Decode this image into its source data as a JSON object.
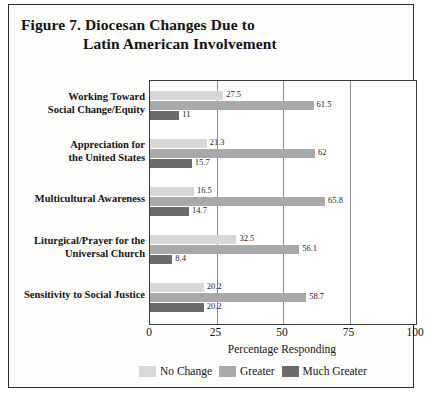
{
  "figure": {
    "title_line_1": "Figure 7.  Diocesan Changes Due to",
    "title_line_2": "Latin American Involvement"
  },
  "chart_data": {
    "type": "bar",
    "orientation": "horizontal",
    "title": "Figure 7.  Diocesan Changes Due to Latin American Involvement",
    "xlabel": "Percentage Responding",
    "ylabel": "",
    "xlim": [
      0,
      100
    ],
    "xticks": [
      0,
      25,
      50,
      75,
      100
    ],
    "grid": true,
    "legend_position": "bottom",
    "categories": [
      "Working Toward Social Change/Equity",
      "Appreciation for the United States",
      "Multicultural Awareness",
      "Liturgical/Prayer for the Universal Church",
      "Sensitivity to Social Justice"
    ],
    "series": [
      {
        "name": "No Change",
        "color": "#d7d7d7",
        "values": [
          27.5,
          21.3,
          16.5,
          32.5,
          20.2
        ]
      },
      {
        "name": "Greater",
        "color": "#a9a9a9",
        "values": [
          61.5,
          62.0,
          65.8,
          56.1,
          58.7
        ]
      },
      {
        "name": "Much Greater",
        "color": "#6b6b6b",
        "values": [
          11.0,
          15.7,
          14.7,
          8.4,
          20.2
        ]
      }
    ],
    "value_labels": [
      [
        "27.5",
        "61.5",
        "11"
      ],
      [
        "21.3",
        "62",
        "15.7"
      ],
      [
        "16.5",
        "65.8",
        "14.7"
      ],
      [
        "32.5",
        "56.1",
        "8.4"
      ],
      [
        "20.2",
        "58.7",
        "20.2"
      ]
    ]
  },
  "categories_display": [
    {
      "line_1": "Working Toward",
      "line_2": "Social Change/Equity"
    },
    {
      "line_1": "Appreciation for",
      "line_2": "the United States"
    },
    {
      "line_1": "Multicultural Awareness",
      "line_2": ""
    },
    {
      "line_1": "Liturgical/Prayer for the",
      "line_2": "Universal Church"
    },
    {
      "line_1": "Sensitivity to Social Justice",
      "line_2": ""
    }
  ],
  "axis": {
    "ticks": [
      "0",
      "25",
      "50",
      "75",
      "100"
    ],
    "title": "Percentage Responding"
  },
  "legend": {
    "items": [
      {
        "label": "No Change",
        "color": "#d7d7d7"
      },
      {
        "label": "Greater",
        "color": "#a9a9a9"
      },
      {
        "label": "Much Greater",
        "color": "#6b6b6b"
      }
    ]
  }
}
